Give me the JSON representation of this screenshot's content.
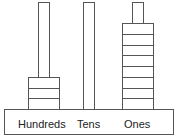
{
  "diagram": {
    "columns": [
      {
        "label": "Hundreds",
        "beads": 3
      },
      {
        "label": "Tens",
        "beads": 0
      },
      {
        "label": "Ones",
        "beads": 8
      }
    ],
    "colors": {
      "stroke": "#555555",
      "fill": "#ffffff",
      "text": "#222222"
    }
  }
}
